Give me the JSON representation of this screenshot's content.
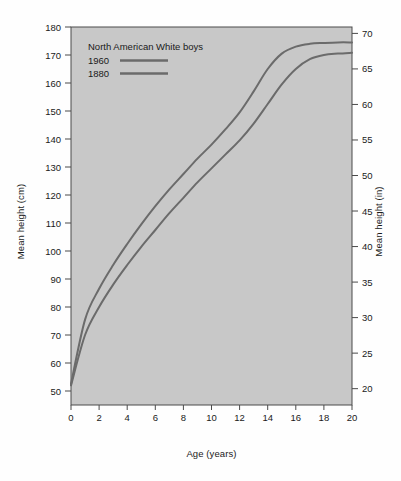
{
  "chart_data": {
    "type": "line",
    "title": "",
    "xlabel": "Age (years)",
    "ylabel": "Mean height (cm)",
    "ylabel_right": "Mean height (in)",
    "xlim": [
      0,
      20
    ],
    "ylim": [
      45,
      180
    ],
    "ylim_right": [
      17.7,
      70.9
    ],
    "xticks": [
      0,
      2,
      4,
      6,
      8,
      10,
      12,
      14,
      16,
      18,
      20
    ],
    "xtick_labels": [
      "0",
      "2",
      "4",
      "6",
      "8",
      "10",
      "12",
      "14",
      "16",
      "18",
      "20"
    ],
    "yticks": [
      50,
      60,
      70,
      80,
      90,
      100,
      110,
      120,
      130,
      140,
      150,
      160,
      170,
      180
    ],
    "ytick_labels": [
      "50",
      "60",
      "70",
      "80",
      "90",
      "100",
      "110",
      "120",
      "130",
      "140",
      "150",
      "160",
      "170",
      "180"
    ],
    "yticks_right": [
      20,
      25,
      30,
      35,
      40,
      45,
      50,
      55,
      60,
      65,
      70
    ],
    "ytick_labels_right": [
      "20",
      "25",
      "30",
      "35",
      "40",
      "45",
      "50",
      "55",
      "60",
      "65",
      "70"
    ],
    "grid": false,
    "legend_position": "upper-left-inside",
    "legend_title": "North American White boys",
    "plot_background": "#c8c8c8",
    "line_color": "#6b6b6b",
    "x": [
      0,
      1,
      2,
      3,
      4,
      5,
      6,
      7,
      8,
      9,
      10,
      11,
      12,
      13,
      14,
      15,
      16,
      17,
      18,
      19,
      20
    ],
    "series": [
      {
        "name": "1960",
        "values": [
          52.5,
          75.5,
          86.5,
          95.0,
          102.5,
          109.5,
          116.0,
          122.0,
          127.5,
          133.0,
          138.0,
          143.5,
          149.5,
          157.0,
          165.0,
          170.5,
          173.0,
          174.0,
          174.3,
          174.5,
          174.5
        ]
      },
      {
        "name": "1880",
        "values": [
          52.0,
          70.0,
          80.0,
          88.0,
          95.0,
          101.5,
          107.5,
          113.5,
          119.0,
          124.5,
          129.5,
          134.5,
          139.5,
          145.5,
          152.5,
          159.5,
          165.0,
          168.5,
          170.0,
          170.5,
          170.8
        ]
      }
    ]
  }
}
